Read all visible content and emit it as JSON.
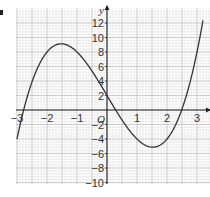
{
  "chart_data": {
    "type": "line",
    "title": "",
    "xlabel": "",
    "ylabel": "y",
    "origin_label": "O",
    "function": "y = x^3 - 7x + 2",
    "xlim": [
      -3.05,
      3.4
    ],
    "ylim": [
      -10,
      13.5
    ],
    "x_ticks": [
      -3,
      -2,
      -1,
      1,
      2,
      3
    ],
    "x_tick_labels": [
      "-3",
      "-2",
      "-1",
      "1",
      "2",
      "3"
    ],
    "y_ticks": [
      -10,
      -8,
      -6,
      -4,
      -2,
      2,
      4,
      6,
      8,
      10,
      12
    ],
    "y_tick_labels": [
      "-10",
      "-8",
      "-6",
      "-4",
      "-2",
      "2",
      "4",
      "6",
      "8",
      "10",
      "12"
    ],
    "grid": true,
    "legend": null,
    "series": [
      {
        "name": "curve",
        "x": [
          -3.0,
          -2.75,
          -2.5,
          -2.25,
          -2.0,
          -1.75,
          -1.5,
          -1.25,
          -1.0,
          -0.75,
          -0.5,
          -0.25,
          0.0,
          0.25,
          0.5,
          0.75,
          1.0,
          1.25,
          1.5,
          1.75,
          2.0,
          2.25,
          2.5,
          2.75,
          3.0,
          3.2
        ],
        "y": [
          -4.0,
          0.45,
          3.88,
          6.36,
          8.0,
          8.89,
          9.13,
          8.8,
          8.0,
          6.83,
          5.38,
          3.73,
          2.0,
          0.27,
          -1.38,
          -2.83,
          -4.0,
          -4.8,
          -5.13,
          -4.89,
          -4.0,
          -2.36,
          0.13,
          3.55,
          8.0,
          12.37
        ]
      }
    ],
    "key_points": {
      "local_max": [
        -1.5,
        9
      ],
      "local_min": [
        1.5,
        -5
      ],
      "y_intercept": [
        0,
        2
      ],
      "roots": [
        -2.8,
        0.3,
        2.5
      ]
    }
  }
}
